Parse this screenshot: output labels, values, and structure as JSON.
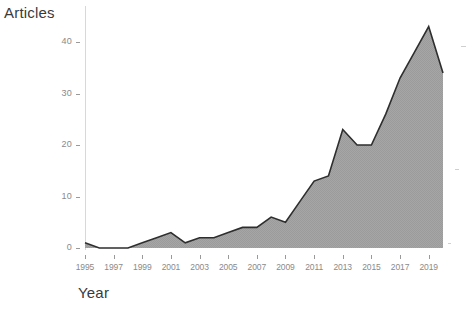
{
  "chart": {
    "type": "area",
    "ylabel": "Articles",
    "xlabel": "Year",
    "fill_color": "#a3a3a3",
    "line_color": "#2e2e2e",
    "tick_color": "#8a8a8a"
  },
  "chart_data": {
    "type": "area",
    "title": "",
    "xlabel": "Year",
    "ylabel": "Articles",
    "x": [
      1995,
      1996,
      1997,
      1998,
      1999,
      2000,
      2001,
      2002,
      2003,
      2004,
      2005,
      2006,
      2007,
      2008,
      2009,
      2010,
      2011,
      2012,
      2013,
      2014,
      2015,
      2016,
      2017,
      2018,
      2019,
      2020
    ],
    "values": [
      1,
      0,
      0,
      0,
      1,
      2,
      3,
      1,
      2,
      2,
      3,
      4,
      4,
      6,
      5,
      9,
      13,
      14,
      23,
      20,
      20,
      26,
      33,
      38,
      43,
      34
    ],
    "xlim": [
      1995,
      2020
    ],
    "ylim": [
      0,
      45
    ],
    "xticks": [
      1995,
      1997,
      1999,
      2001,
      2003,
      2005,
      2007,
      2009,
      2011,
      2013,
      2015,
      2017,
      2019
    ],
    "xtick_labels": [
      "1995",
      "1997",
      "1999",
      "2001",
      "2003",
      "2005",
      "2007",
      "2009",
      "2011",
      "2013",
      "2015",
      "2017",
      "2019"
    ],
    "yticks": [
      0,
      10,
      20,
      30,
      40
    ],
    "ytick_labels": [
      "0",
      "10",
      "20",
      "30",
      "40"
    ],
    "grid": false,
    "legend": null,
    "series": [
      {
        "name": "Articles",
        "values": [
          1,
          0,
          0,
          0,
          1,
          2,
          3,
          1,
          2,
          2,
          3,
          4,
          4,
          6,
          5,
          9,
          13,
          14,
          23,
          20,
          20,
          26,
          33,
          38,
          43,
          34
        ]
      }
    ]
  }
}
